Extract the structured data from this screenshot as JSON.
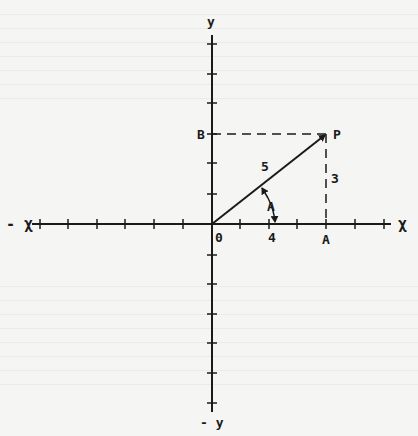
{
  "diagram": {
    "type": "coordinate-plane",
    "axes": {
      "x_positive_label": "χ",
      "x_negative_label": "- χ",
      "y_positive_label": "y",
      "y_negative_label": "- y"
    },
    "origin_label": "0",
    "points": {
      "P": "P",
      "A": "A",
      "B": "B"
    },
    "segments": {
      "hypotenuse_length": "5",
      "vertical_length": "3",
      "horizontal_length": "4"
    },
    "angle_label": "A",
    "colors": {
      "ink": "#1a1a1a",
      "paper": "#f5f5f4"
    }
  }
}
